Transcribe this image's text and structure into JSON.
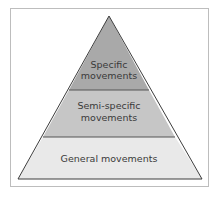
{
  "diagram": {
    "type": "pyramid",
    "tiers": [
      {
        "lines": [
          "Specific",
          "movements"
        ],
        "color": "#a9a9a9"
      },
      {
        "lines": [
          "Semi-specific",
          "movements"
        ],
        "color": "#c6c6c6"
      },
      {
        "lines": [
          "General movements"
        ],
        "color": "#e9e9e9"
      }
    ],
    "outline_color": "#3c3c3c",
    "frame_color": "#bdbdbd"
  }
}
